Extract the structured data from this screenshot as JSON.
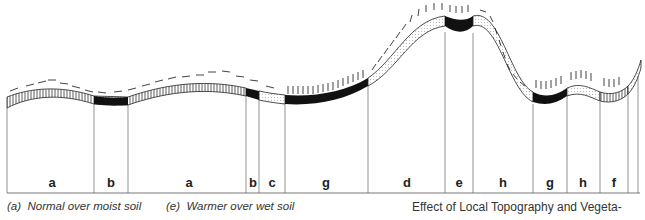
{
  "diagram": {
    "title": "Effect of Local Topography and Vegeta-",
    "segments": [
      {
        "label": "a",
        "x0": 7,
        "x1": 94,
        "type": "normal-moist"
      },
      {
        "label": "b",
        "x0": 94,
        "x1": 128,
        "type": "cooler"
      },
      {
        "label": "a",
        "x0": 128,
        "x1": 246,
        "type": "normal-moist"
      },
      {
        "label": "b",
        "x0": 246,
        "x1": 259,
        "type": "cooler"
      },
      {
        "label": "c",
        "x0": 259,
        "x1": 285,
        "type": "other"
      },
      {
        "label": "g",
        "x0": 285,
        "x1": 368,
        "type": "cold-sink"
      },
      {
        "label": "d",
        "x0": 368,
        "x1": 445,
        "type": "warm-slope"
      },
      {
        "label": "e",
        "x0": 445,
        "x1": 473,
        "type": "warmer-wet"
      },
      {
        "label": "h",
        "x0": 473,
        "x1": 533,
        "type": "slope"
      },
      {
        "label": "g",
        "x0": 533,
        "x1": 567,
        "type": "cold-sink"
      },
      {
        "label": "h",
        "x0": 567,
        "x1": 600,
        "type": "slope"
      },
      {
        "label": "f",
        "x0": 600,
        "x1": 628,
        "type": "other"
      },
      {
        "label": "",
        "x0": 628,
        "x1": 638,
        "type": "other"
      }
    ],
    "legend": [
      {
        "key": "(a)",
        "text": "Normal over moist soil"
      },
      {
        "key": "(e)",
        "text": "Warmer over wet soil"
      }
    ],
    "colors": {
      "ink": "#111111",
      "line": "#555555",
      "background": "#ffffff"
    }
  }
}
